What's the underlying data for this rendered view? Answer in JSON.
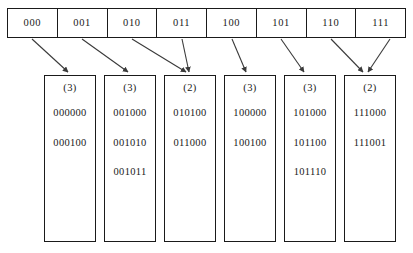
{
  "figure": {
    "colors": {
      "ink": "#1a1a1a",
      "background": "#ffffff",
      "arrow": "#3a3a3a"
    }
  },
  "directory": {
    "name": "hash-directory",
    "cells": [
      {
        "label": "000",
        "bucket_index": 0
      },
      {
        "label": "001",
        "bucket_index": 1
      },
      {
        "label": "010",
        "bucket_index": 2
      },
      {
        "label": "011",
        "bucket_index": 2
      },
      {
        "label": "100",
        "bucket_index": 3
      },
      {
        "label": "101",
        "bucket_index": 4
      },
      {
        "label": "110",
        "bucket_index": 5
      },
      {
        "label": "111",
        "bucket_index": 5
      }
    ]
  },
  "buckets": [
    {
      "depth_label": "(3)",
      "keys": [
        "000000",
        "000100"
      ]
    },
    {
      "depth_label": "(3)",
      "keys": [
        "001000",
        "001010",
        "001011"
      ]
    },
    {
      "depth_label": "(2)",
      "keys": [
        "010100",
        "011000"
      ]
    },
    {
      "depth_label": "(3)",
      "keys": [
        "100000",
        "100100"
      ]
    },
    {
      "depth_label": "(3)",
      "keys": [
        "101000",
        "101100",
        "101110"
      ]
    },
    {
      "depth_label": "(2)",
      "keys": [
        "111000",
        "111001"
      ]
    }
  ],
  "arrows": [
    {
      "from_cell": 0,
      "to_bucket": 0
    },
    {
      "from_cell": 1,
      "to_bucket": 1
    },
    {
      "from_cell": 2,
      "to_bucket": 2
    },
    {
      "from_cell": 3,
      "to_bucket": 2
    },
    {
      "from_cell": 4,
      "to_bucket": 3
    },
    {
      "from_cell": 5,
      "to_bucket": 4
    },
    {
      "from_cell": 6,
      "to_bucket": 5
    },
    {
      "from_cell": 7,
      "to_bucket": 5
    }
  ]
}
